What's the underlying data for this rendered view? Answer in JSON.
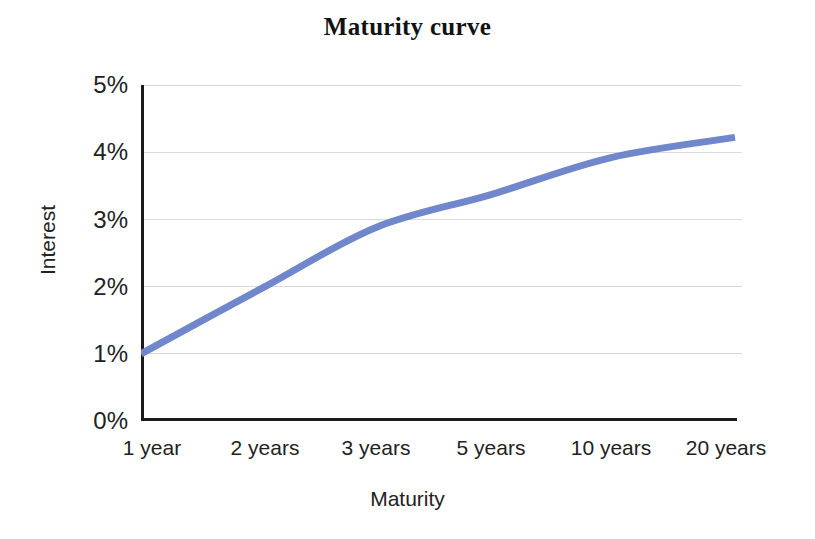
{
  "chart_data": {
    "type": "line",
    "title": "Maturity curve",
    "xlabel": "Maturity",
    "ylabel": "Interest",
    "categories": [
      "1 year",
      "2 years",
      "3 years",
      "5 years",
      "10 years",
      "20 years"
    ],
    "values": [
      1.0,
      2.0,
      2.88,
      3.37,
      3.92,
      4.22
    ],
    "value_suffix": "%",
    "ylim": [
      0,
      5
    ],
    "y_ticks": [
      "0%",
      "1%",
      "2%",
      "3%",
      "4%",
      "5%"
    ],
    "y_tick_values": [
      0,
      1,
      2,
      3,
      4,
      5
    ],
    "grid": "horizontal",
    "legend": "none",
    "series": [
      {
        "name": "Maturity curve",
        "color": "#7187cc",
        "values": [
          1.0,
          2.0,
          2.88,
          3.37,
          3.92,
          4.22
        ],
        "line_width": 7,
        "smooth": true,
        "markers": "none"
      }
    ],
    "colors": {
      "line": "#7187cc",
      "axis": "#1a1a1a",
      "grid": "#d9d9d9",
      "background": "#ffffff",
      "text": "#222222"
    }
  }
}
